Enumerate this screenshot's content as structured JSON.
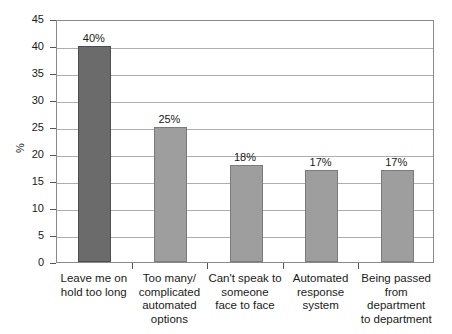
{
  "chart_data": {
    "type": "bar",
    "title": "",
    "xlabel": "",
    "ylabel": "%",
    "ylim": [
      0,
      45
    ],
    "ytick_step": 5,
    "grid": true,
    "legend": "none",
    "categories": [
      "Leave me on hold too long",
      "Too many/ complicated automated options",
      "Can't speak to someone face to face",
      "Automated response system",
      "Being passed from department to department"
    ],
    "category_lines": [
      [
        "Leave me on",
        "hold too long"
      ],
      [
        "Too many/",
        "complicated",
        "automated",
        "options"
      ],
      [
        "Can't speak to",
        "someone",
        "face to face"
      ],
      [
        "Automated",
        "response",
        "system"
      ],
      [
        "Being passed",
        "from department",
        "to department"
      ]
    ],
    "values": [
      40,
      25,
      18,
      17,
      17
    ],
    "value_labels": [
      "40%",
      "25%",
      "18%",
      "17%",
      "17%"
    ],
    "bar_colors": [
      "#6b6b6b",
      "#9e9e9e",
      "#9e9e9e",
      "#9e9e9e",
      "#9e9e9e"
    ],
    "yticks": [
      45,
      40,
      35,
      30,
      25,
      20,
      15,
      10,
      5,
      0
    ],
    "ytick_labels": [
      "45",
      "40",
      "35",
      "30",
      "25",
      "20",
      "15",
      "10",
      "5",
      "0"
    ]
  },
  "axis": {
    "y_title": "%"
  }
}
